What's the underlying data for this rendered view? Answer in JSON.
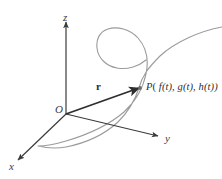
{
  "figure": {
    "name": "space-curve-position-vector-diagram",
    "type": "3d-coordinate-diagram",
    "background_color": "#ffffff",
    "axes": {
      "z": {
        "label": "z",
        "origin": [
          66,
          114
        ],
        "tip": [
          66,
          22
        ],
        "color": "#3b3b3b"
      },
      "y": {
        "label": "y",
        "origin": [
          66,
          114
        ],
        "tip": [
          158,
          136
        ],
        "color": "#3b3b3b"
      },
      "x": {
        "label": "x",
        "origin": [
          66,
          114
        ],
        "tip": [
          18,
          160
        ],
        "color": "#3b3b3b"
      }
    },
    "origin": {
      "label": "O",
      "position": [
        66,
        114
      ]
    },
    "vector": {
      "label": "r",
      "from": [
        66,
        114
      ],
      "to": [
        139,
        88
      ],
      "color": "#2e2e2e",
      "style": "bold-arrow"
    },
    "point": {
      "marker_position": [
        140,
        88
      ],
      "label_text": "P( f(t), g(t), h(t))",
      "label_parts": {
        "p": "P",
        "open": "( ",
        "f": "f",
        "ft": "(t), ",
        "g": "g",
        "gt": "(t), ",
        "h": "h",
        "ht": "(t))"
      },
      "color": "#2e2e2e"
    },
    "curve": {
      "description": "space curve with loop, passing through P, descending to lower left and extending to upper right",
      "color": "#9b9b9b",
      "stroke_width": 1.1,
      "path": "M 222,27 C 200,31 175,42 160,56 C 148,68 142,76 139,88 C 135,100 128,112 118,122 C 105,134 86,143 66,147 C 55,149 46,148 38,146 C 46,146 56,144 66,141 C 90,134 110,124 124,112 C 136,101 143,88 146,74 C 149,60 146,47 138,38 C 130,29 117,26 108,29 C 99,32 96,40 97,48 C 98,58 106,66 117,68 C 128,70 139,66 146,60"
    }
  }
}
